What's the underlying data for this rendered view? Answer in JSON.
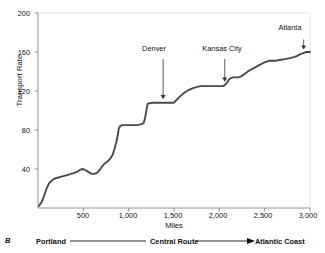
{
  "figure": {
    "panel_letter": "B",
    "axis_line_color": "#7a7a7a",
    "series_color": "#4a4a4a",
    "background": "#ffffff"
  },
  "chart_data": {
    "type": "line",
    "title": "",
    "xlabel": "Miles",
    "ylabel": "Transport Rate",
    "xlim": [
      0,
      3000
    ],
    "ylim": [
      0,
      200
    ],
    "grid": false,
    "legend": "none",
    "xticks": [
      500,
      1000,
      1500,
      2000,
      2500,
      3000
    ],
    "xtick_labels": [
      "500",
      "1,000",
      "1,500",
      "2,000",
      "2,500",
      "3,000"
    ],
    "yticks": [
      40,
      80,
      120,
      160,
      200
    ],
    "ytick_labels": [
      "40",
      "80",
      "120",
      "160",
      "200"
    ],
    "series": [
      {
        "name": "Transport Rate",
        "x": [
          10,
          40,
          70,
          95,
          120,
          150,
          180,
          215,
          250,
          290,
          330,
          365,
          400,
          430,
          460,
          490,
          520,
          555,
          590,
          620,
          650,
          680,
          710,
          740,
          770,
          800,
          825,
          845,
          865,
          880,
          890,
          905,
          930,
          980,
          1040,
          1100,
          1140,
          1165,
          1180,
          1195,
          1210,
          1260,
          1320,
          1380,
          1440,
          1500,
          1520,
          1560,
          1610,
          1660,
          1710,
          1750,
          1790,
          1850,
          1920,
          1990,
          2040,
          2060,
          2080,
          2100,
          2120,
          2150,
          2180,
          2210,
          2240,
          2270,
          2300,
          2330,
          2370,
          2410,
          2450,
          2490,
          2520,
          2545,
          2570,
          2620,
          2680,
          2740,
          2790,
          2830,
          2860,
          2880,
          2900,
          2930,
          2960,
          2985,
          3000
        ],
        "y": [
          2,
          6,
          13,
          20,
          25,
          28,
          30,
          31,
          32,
          33,
          34,
          35,
          36,
          37,
          39,
          40,
          39,
          37,
          35,
          35,
          36,
          39,
          43,
          46,
          48,
          51,
          55,
          61,
          68,
          75,
          81,
          84,
          85,
          85,
          85,
          85,
          86,
          87,
          92,
          100,
          107,
          108,
          108,
          108,
          108,
          108,
          110,
          114,
          118,
          121,
          123,
          124,
          125,
          125,
          125,
          125,
          125,
          126,
          128,
          131,
          133,
          134,
          134,
          134,
          135,
          137,
          139,
          141,
          143,
          145,
          147,
          149,
          150,
          151,
          151,
          151,
          152,
          153,
          154,
          155,
          156,
          157,
          158,
          159,
          160,
          160,
          160
        ]
      }
    ],
    "annotations": [
      {
        "label": "Denver",
        "x": 1380,
        "y": 108,
        "label_y_value": 160
      },
      {
        "label": "Kansas City",
        "x": 2060,
        "y": 126,
        "label_y_value": 160
      },
      {
        "label": "Atlanta",
        "x": 2930,
        "y": 159,
        "label_y_value": 180
      }
    ]
  },
  "footer": {
    "left_label": "Portland",
    "center_label": "Central Route",
    "right_label": "Atlantic Coast"
  }
}
